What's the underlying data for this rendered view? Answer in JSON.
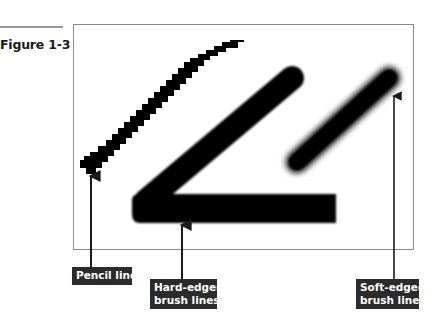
{
  "figure": {
    "label": "Figure 1-3"
  },
  "illustration": {
    "frame_color": "#8a8a8a",
    "stroke_color": "#000000",
    "strokes": [
      {
        "name": "pencil-line",
        "style": "jagged / aliased"
      },
      {
        "name": "hard-edged-brush-lines",
        "style": "anti-aliased, crisp edge"
      },
      {
        "name": "soft-edged-brush-line",
        "style": "feathered / blurred edge"
      }
    ]
  },
  "callouts": [
    {
      "id": "pencil",
      "lines": [
        "Pencil line"
      ]
    },
    {
      "id": "hard",
      "lines": [
        "Hard-edged",
        "brush lines"
      ]
    },
    {
      "id": "soft",
      "lines": [
        "Soft-edged",
        "brush line"
      ]
    }
  ],
  "colors": {
    "callout_bg": "#2b2b2b",
    "callout_text": "#ffffff",
    "leader": "#1a1a1a"
  }
}
